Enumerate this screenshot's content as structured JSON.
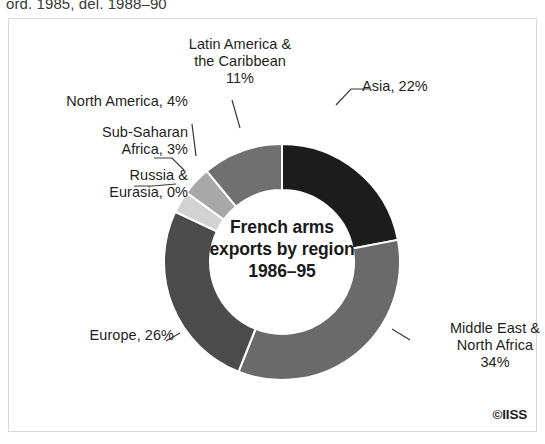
{
  "top_caption": "ord. 1985, del. 1988–90",
  "credit": "©IISS",
  "center_title": "French arms\nexports by region\n1986–95",
  "labels": {
    "latin_america": "Latin America &\nthe Caribbean\n11%",
    "asia": "Asia, 22%",
    "north_america": "North America, 4%",
    "sub_saharan": "Sub-Saharan\nAfrica, 3%",
    "russia": "Russia &\nEurasia, 0%",
    "europe": "Europe, 26%",
    "middle_east": "Middle East &\nNorth Africa\n34%"
  },
  "chart_data": {
    "type": "pie",
    "variant": "donut",
    "title": "French arms exports by region 1986–95",
    "unit": "percent",
    "total": 100,
    "legend": "labels-outside-with-leader-lines",
    "grid": false,
    "categories": [
      "Asia",
      "Middle East & North Africa",
      "Europe",
      "Russia & Eurasia",
      "Sub-Saharan Africa",
      "North America",
      "Latin America & the Caribbean"
    ],
    "values": [
      22,
      34,
      26,
      0,
      3,
      4,
      11
    ],
    "slices": [
      {
        "label": "Asia",
        "value": 22,
        "display": "Asia, 22%",
        "color": "#1c1c1c"
      },
      {
        "label": "Middle East & North Africa",
        "value": 34,
        "display": "Middle East &\nNorth Africa\n34%",
        "color": "#6a6a6a"
      },
      {
        "label": "Europe",
        "value": 26,
        "display": "Europe, 26%",
        "color": "#4b4b4b"
      },
      {
        "label": "Russia & Eurasia",
        "value": 0,
        "display": "Russia &\nEurasia, 0%",
        "color": "#8f8f8f"
      },
      {
        "label": "Sub-Saharan Africa",
        "value": 3,
        "display": "Sub-Saharan\nAfrica, 3%",
        "color": "#d2d2d2"
      },
      {
        "label": "North America",
        "value": 4,
        "display": "North America, 4%",
        "color": "#a8a8a8"
      },
      {
        "label": "Latin America & the Caribbean",
        "value": 11,
        "display": "Latin America &\nthe Caribbean\n11%",
        "color": "#707070"
      }
    ],
    "colors": {
      "background": "#ffffff",
      "frame": "#d8d8d8",
      "text": "#231f20",
      "leader_line": "#3a3a3a",
      "slice_separator": "#ffffff"
    }
  }
}
